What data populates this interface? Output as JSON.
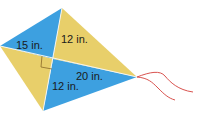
{
  "diagram": {
    "type": "kite",
    "vertices": {
      "top": [
        62,
        8
      ],
      "left": [
        0,
        46
      ],
      "right": [
        137,
        77
      ],
      "bottom": [
        43,
        111
      ],
      "center": [
        53,
        59
      ]
    },
    "colors": {
      "blue": "#3da0e0",
      "yellow": "#e8cf6a",
      "string": "#d9534f",
      "right_angle": "#8a6a2a"
    },
    "labels": {
      "top_left": "15 in.",
      "top_right": "12 in.",
      "bottom_right": "20 in.",
      "bottom_left": "12 in."
    }
  }
}
